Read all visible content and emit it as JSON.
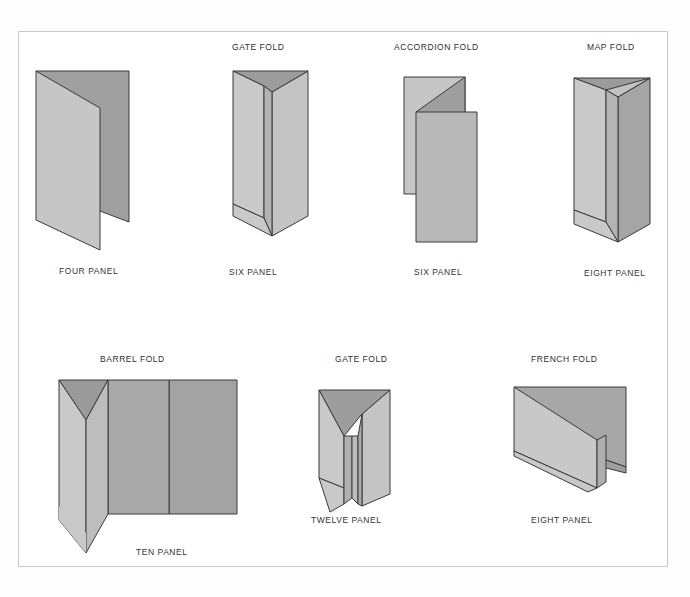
{
  "page": {
    "background_color": "#fefefe",
    "frame_color": "#c9c9c9",
    "text_color": "#353535"
  },
  "palette": {
    "light_face": "#c9c9c9",
    "mid_face": "#b5b5b5",
    "dark_face": "#9d9d9d",
    "darker_face": "#949494",
    "outline": "#3a3a3a"
  },
  "figures": [
    {
      "id": "four-panel",
      "fold_name": "",
      "panel_count_label": "FOUR PANEL",
      "row": 1,
      "column": 1
    },
    {
      "id": "gate-fold-six",
      "fold_name": "GATE FOLD",
      "panel_count_label": "SIX PANEL",
      "row": 1,
      "column": 2
    },
    {
      "id": "accordion-fold-six",
      "fold_name": "ACCORDION FOLD",
      "panel_count_label": "SIX PANEL",
      "row": 1,
      "column": 3
    },
    {
      "id": "map-fold-eight",
      "fold_name": "MAP FOLD",
      "panel_count_label": "EIGHT PANEL",
      "row": 1,
      "column": 4
    },
    {
      "id": "barrel-fold-ten",
      "fold_name": "BARREL FOLD",
      "panel_count_label": "TEN PANEL",
      "row": 2,
      "column": 1
    },
    {
      "id": "gate-fold-twelve",
      "fold_name": "GATE FOLD",
      "panel_count_label": "TWELVE PANEL",
      "row": 2,
      "column": 2
    },
    {
      "id": "french-fold-eight",
      "fold_name": "FRENCH FOLD",
      "panel_count_label": "EIGHT PANEL",
      "row": 2,
      "column": 3
    }
  ],
  "labels": {
    "four_panel": "FOUR PANEL",
    "gate_fold_1": "GATE FOLD",
    "six_panel_1": "SIX PANEL",
    "accordion_fold": "ACCORDION FOLD",
    "six_panel_2": "SIX PANEL",
    "map_fold": "MAP FOLD",
    "eight_panel_1": "EIGHT PANEL",
    "barrel_fold": "BARREL FOLD",
    "ten_panel": "TEN PANEL",
    "gate_fold_2": "GATE FOLD",
    "twelve_panel": "TWELVE PANEL",
    "french_fold": "FRENCH FOLD",
    "eight_panel_2": "EIGHT PANEL"
  }
}
